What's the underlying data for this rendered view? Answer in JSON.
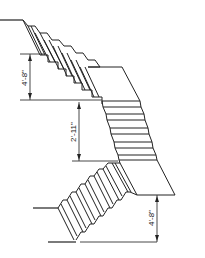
{
  "drawing": {
    "title": "Staircase elevation with landings",
    "dimensions": {
      "upper_rise": "4'-8\"",
      "middle_rise": "2'-11\"",
      "lower_rise": "4'-8\""
    },
    "colors": {
      "line": "#222222",
      "background": "#ffffff"
    }
  }
}
